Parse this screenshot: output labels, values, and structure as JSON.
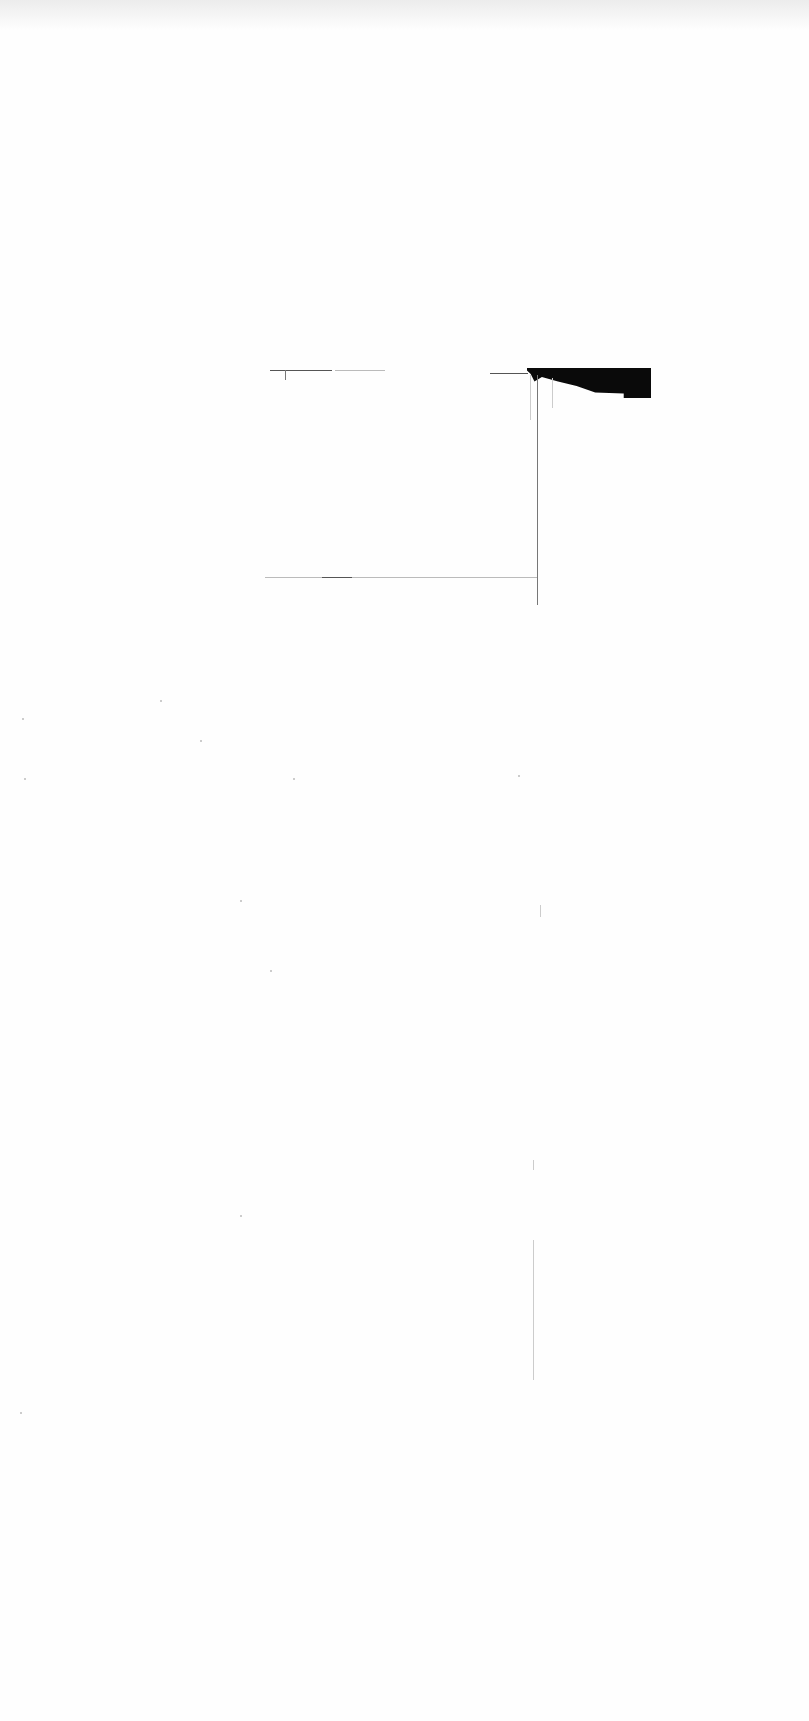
{
  "document": {
    "legible_text": [],
    "marks": {
      "header_rule_left": {
        "x": 270,
        "y": 370,
        "w": 62
      },
      "header_rule_left_dashes": {
        "x": 335,
        "y": 370,
        "w": 50
      },
      "header_rule_right": {
        "x": 490,
        "y": 373,
        "w": 38
      },
      "filled_block": {
        "x": 527,
        "y": 368,
        "w": 124,
        "h": 30,
        "color": "#0a0a0a"
      },
      "vertical_line": {
        "x": 537,
        "y": 375,
        "h": 230
      },
      "footer_rule": {
        "x": 265,
        "y": 577,
        "w": 272
      },
      "lower_vertical_trace": {
        "x": 533,
        "y": 1240,
        "h": 140
      }
    }
  }
}
